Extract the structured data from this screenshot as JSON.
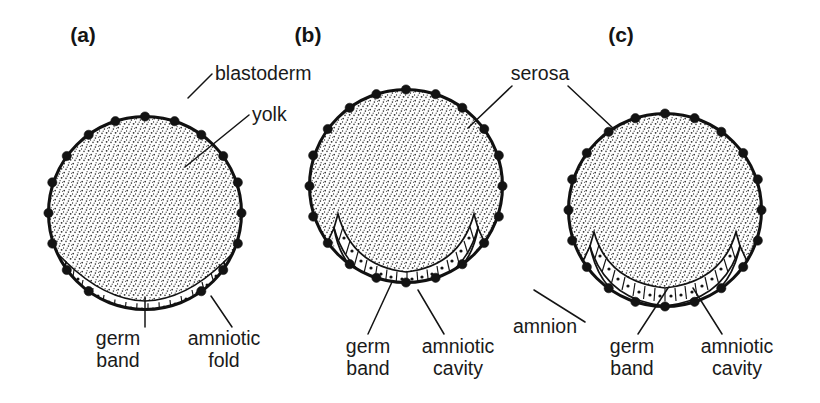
{
  "figure": {
    "width": 820,
    "height": 403,
    "background": "#ffffff",
    "ink_color": "#131313",
    "stipple_color": "#2a2a2a"
  },
  "panels": [
    {
      "letter": "(a)",
      "letter_x": 83,
      "letter_y": 42,
      "cx": 145,
      "cy": 213,
      "r": 98,
      "stage": "amniotic folds beginning to form at edges of germ band",
      "labels": [
        {
          "name": "blastoderm",
          "text": "blastoderm",
          "x": 215,
          "y": 80,
          "anchor": "start",
          "leader": [
            [
              212,
              74
            ],
            [
              188,
              98
            ]
          ]
        },
        {
          "name": "yolk",
          "text": "yolk",
          "x": 252,
          "y": 121,
          "anchor": "start",
          "leader": [
            [
              249,
              115
            ],
            [
              185,
              167
            ]
          ]
        },
        {
          "name": "germ-band",
          "text": [
            "germ",
            "band"
          ],
          "x": 118,
          "y": 345,
          "anchor": "middle",
          "leader": [
            [
              145,
              327
            ],
            [
              145,
              297
            ]
          ]
        },
        {
          "name": "amniotic-fold",
          "text": [
            "amniotic",
            "fold"
          ],
          "x": 222,
          "y": 345,
          "anchor": "middle",
          "leader": [
            [
              230,
              327
            ],
            [
              212,
              297
            ]
          ]
        }
      ]
    },
    {
      "letter": "(b)",
      "letter_x": 308,
      "letter_y": 42,
      "cx": 406,
      "cy": 186,
      "r": 98,
      "stage": "amniotic folds have fused; amniotic cavity enclosed beneath germ band",
      "labels": [
        {
          "name": "germ-band",
          "text": [
            "germ",
            "band"
          ],
          "x": 368,
          "y": 353,
          "anchor": "middle",
          "leader": [
            [
              368,
              334
            ],
            [
              392,
              282
            ]
          ]
        },
        {
          "name": "amniotic-cavity",
          "text": [
            "amniotic",
            "cavity"
          ],
          "x": 458,
          "y": 353,
          "anchor": "middle",
          "leader": [
            [
              444,
              334
            ],
            [
              418,
              290
            ]
          ]
        }
      ]
    },
    {
      "letter": "(c)",
      "letter_x": 621,
      "letter_y": 42,
      "cx": 665,
      "cy": 210,
      "r": 98,
      "stage": "germ band fully covered by amnion; serosa surrounds whole egg",
      "labels": [
        {
          "name": "germ-band",
          "text": [
            "germ",
            "band"
          ],
          "x": 632,
          "y": 353,
          "anchor": "middle",
          "leader": [
            [
              638,
              334
            ],
            [
              668,
              288
            ]
          ]
        },
        {
          "name": "amniotic-cavity",
          "text": [
            "amniotic",
            "cavity"
          ],
          "x": 737,
          "y": 353,
          "anchor": "middle",
          "leader": [
            [
              722,
              334
            ],
            [
              693,
              288
            ]
          ]
        }
      ]
    }
  ],
  "shared_labels": [
    {
      "name": "serosa",
      "text": "serosa",
      "x": 540,
      "y": 80,
      "anchor": "middle",
      "leaders": [
        [
          [
            512,
            86
          ],
          [
            468,
            128
          ]
        ],
        [
          [
            568,
            86
          ],
          [
            615,
            130
          ]
        ]
      ]
    },
    {
      "name": "amnion",
      "text": "amnion",
      "x": 545,
      "y": 333,
      "anchor": "middle",
      "leaders": [
        [
          [
            585,
            322
          ],
          [
            534,
            290
          ]
        ]
      ]
    }
  ],
  "legend_terms": [
    "blastoderm",
    "yolk",
    "serosa",
    "amnion",
    "germ band",
    "amniotic fold",
    "amniotic cavity"
  ]
}
